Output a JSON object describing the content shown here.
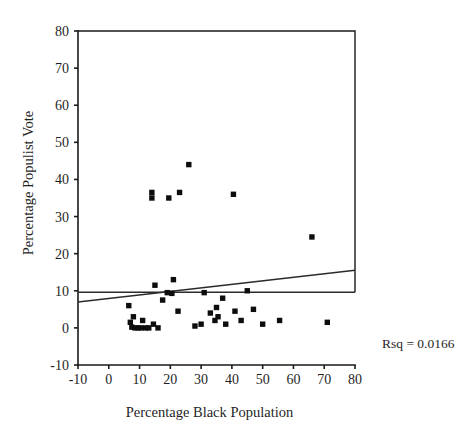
{
  "chart_data": {
    "type": "scatter",
    "title": "",
    "xlabel": "Percentage Black Population",
    "ylabel": "Percentage Populist Vote",
    "xlim": [
      -10,
      80
    ],
    "ylim": [
      -10,
      80
    ],
    "xticks": [
      -10,
      0,
      10,
      20,
      30,
      40,
      50,
      60,
      70,
      80
    ],
    "yticks": [
      -10,
      0,
      10,
      20,
      30,
      40,
      50,
      60,
      70,
      80
    ],
    "xtick_labels": [
      "-10",
      "0",
      "10",
      "20",
      "30",
      "40",
      "50",
      "60",
      "70",
      "80"
    ],
    "ytick_labels": [
      "-10",
      "0",
      "10",
      "20",
      "30",
      "40",
      "50",
      "60",
      "70",
      "80"
    ],
    "grid": false,
    "legend": false,
    "marker": "square",
    "marker_color": "#0d0d0d",
    "series": [
      {
        "name": "Counties",
        "points": [
          [
            6.5,
            6.0
          ],
          [
            7.0,
            1.5
          ],
          [
            7.5,
            0.2
          ],
          [
            8.0,
            3.0
          ],
          [
            8.5,
            0.0
          ],
          [
            9.5,
            0.0
          ],
          [
            10.5,
            0.0
          ],
          [
            11.0,
            2.0
          ],
          [
            12.0,
            0.0
          ],
          [
            13.0,
            0.0
          ],
          [
            14.0,
            36.5
          ],
          [
            14.0,
            35.0
          ],
          [
            14.5,
            1.0
          ],
          [
            15.0,
            11.5
          ],
          [
            16.0,
            0.0
          ],
          [
            17.5,
            7.5
          ],
          [
            19.0,
            9.5
          ],
          [
            19.5,
            35.0
          ],
          [
            20.5,
            9.3
          ],
          [
            21.0,
            13.0
          ],
          [
            22.5,
            4.5
          ],
          [
            23.0,
            36.5
          ],
          [
            26.0,
            44.0
          ],
          [
            28.0,
            0.5
          ],
          [
            30.0,
            1.0
          ],
          [
            31.0,
            9.5
          ],
          [
            33.0,
            4.0
          ],
          [
            34.5,
            2.0
          ],
          [
            35.0,
            5.5
          ],
          [
            35.5,
            3.0
          ],
          [
            37.0,
            8.0
          ],
          [
            38.0,
            1.0
          ],
          [
            40.5,
            36.0
          ],
          [
            41.0,
            4.5
          ],
          [
            43.0,
            2.0
          ],
          [
            45.0,
            10.0
          ],
          [
            47.0,
            5.0
          ],
          [
            50.0,
            1.0
          ],
          [
            55.5,
            2.0
          ],
          [
            66.0,
            24.5
          ],
          [
            71.0,
            1.5
          ]
        ]
      }
    ],
    "reference_line": {
      "name": "mean-line",
      "type": "horizontal",
      "y": 9.6
    },
    "fit_line": {
      "name": "regression-line",
      "x_start": -10,
      "y_start": 7.0,
      "x_end": 80,
      "y_end": 15.5
    },
    "annotations": [
      {
        "name": "rsq-annotation",
        "text": "Rsq = 0.0166",
        "x": 382,
        "y": 348
      }
    ]
  }
}
